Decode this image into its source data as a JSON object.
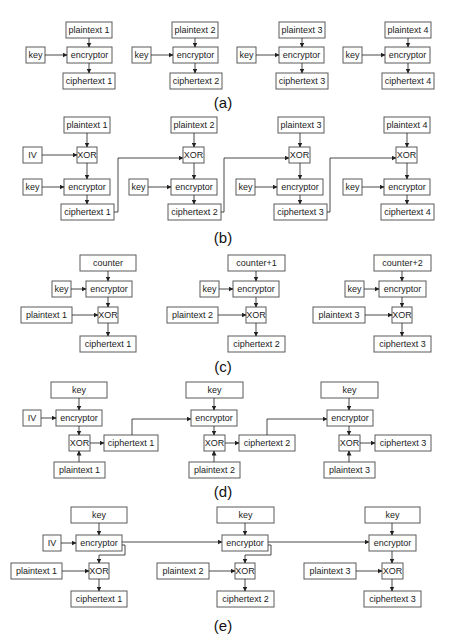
{
  "diagram": {
    "panels": [
      {
        "id": "a",
        "caption": "(a)",
        "mode_implied": "ECB",
        "labels": {
          "key": "key",
          "encryptor": "encryptor",
          "plaintexts": [
            "plaintext 1",
            "plaintext 2",
            "plaintext 3",
            "plaintext 4"
          ],
          "ciphertexts": [
            "ciphertext 1",
            "ciphertext 2",
            "ciphertext 3",
            "ciphertext 4"
          ]
        }
      },
      {
        "id": "b",
        "caption": "(b)",
        "mode_implied": "CBC",
        "labels": {
          "iv": "IV",
          "xor": "XOR",
          "key": "key",
          "encryptor": "encryptor",
          "plaintexts": [
            "plaintext 1",
            "plaintext 2",
            "plaintext 3",
            "plaintext 4"
          ],
          "ciphertexts": [
            "ciphertext 1",
            "ciphertext 2",
            "ciphertext 3",
            "ciphertext 4"
          ]
        }
      },
      {
        "id": "c",
        "caption": "(c)",
        "mode_implied": "CTR",
        "labels": {
          "counters": [
            "counter",
            "counter+1",
            "counter+2"
          ],
          "key": "key",
          "encryptor": "encryptor",
          "xor": "XOR",
          "plaintexts": [
            "plaintext 1",
            "plaintext 2",
            "plaintext 3"
          ],
          "ciphertexts": [
            "ciphertext 1",
            "ciphertext 2",
            "ciphertext 3"
          ]
        }
      },
      {
        "id": "d",
        "caption": "(d)",
        "mode_implied": "CFB",
        "labels": {
          "iv": "IV",
          "key": "key",
          "encryptor": "encryptor",
          "xor": "XOR",
          "plaintexts": [
            "plaintext 1",
            "plaintext 2",
            "plaintext 3"
          ],
          "ciphertexts": [
            "ciphertext 1",
            "ciphertext 2",
            "ciphertext 3"
          ]
        }
      },
      {
        "id": "e",
        "caption": "(e)",
        "mode_implied": "OFB",
        "labels": {
          "iv": "IV",
          "key": "key",
          "encryptor": "encryptor",
          "xor": "XOR",
          "plaintexts": [
            "plaintext 1",
            "plaintext 2",
            "plaintext 3"
          ],
          "ciphertexts": [
            "ciphertext 1",
            "ciphertext 2",
            "ciphertext 3"
          ]
        }
      }
    ]
  }
}
